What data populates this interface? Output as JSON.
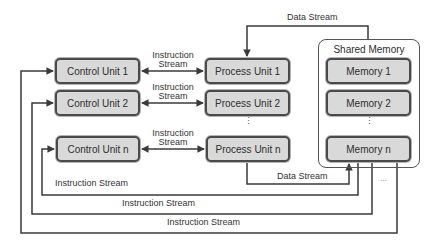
{
  "diagram": {
    "control_units": [
      {
        "label": "Control Unit 1"
      },
      {
        "label": "Control Unit 2"
      },
      {
        "label": "Control Unit n"
      }
    ],
    "process_units": [
      {
        "label": "Process Unit 1"
      },
      {
        "label": "Process Unit 2"
      },
      {
        "label": "Process Unit n"
      }
    ],
    "shared_memory": {
      "title": "Shared Memory",
      "modules": [
        {
          "label": "Memory 1"
        },
        {
          "label": "Memory 2"
        },
        {
          "label": "Memory n"
        }
      ]
    },
    "links": {
      "cu_pu_label_line1": "Instruction",
      "cu_pu_label_line2": "Stream",
      "data_stream_top": "Data Stream",
      "data_stream_bottom": "Data Stream",
      "instruction_stream_1": "Instruction Stream",
      "instruction_stream_2": "Instruction Stream",
      "instruction_stream_3": "Instruction Stream"
    },
    "ellipsis_vertical": "⋮",
    "ellipsis_horizontal": "...",
    "colors": {
      "box_fill": "#d9d9d9",
      "box_border": "#4a4a4a",
      "line": "#3a3a3a"
    }
  }
}
